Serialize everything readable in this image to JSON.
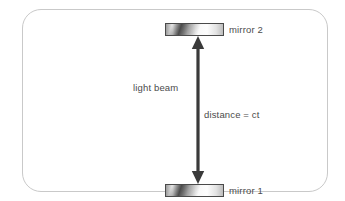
{
  "figure": {
    "type": "physics-diagram",
    "width": 345,
    "height": 201,
    "background_color": "#ffffff",
    "frame": {
      "border_color": "#c9c9c9",
      "fill_color": "#ffffff",
      "corner_radius": 19
    }
  },
  "mirrors": [
    {
      "id": "mirror-2",
      "label": "mirror 2",
      "position": "top",
      "fill_description": "metallic grey gradient",
      "border_color": "#4a4a4a"
    },
    {
      "id": "mirror-1",
      "label": "mirror 1",
      "position": "bottom",
      "fill_description": "metallic grey gradient",
      "border_color": "#4a4a4a"
    }
  ],
  "arrow": {
    "name": "light-beam-arrow",
    "style": "double-headed vertical",
    "color": "#3a3a3a",
    "from": "mirror 1",
    "to": "mirror 2"
  },
  "annotations": {
    "beam_label": "light beam",
    "distance_label": "distance = ct"
  },
  "text_color": "#4b4b4b"
}
